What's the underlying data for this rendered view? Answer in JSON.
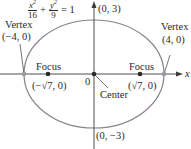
{
  "equation": {
    "term1_num": "x",
    "term1_den": "16",
    "plus": "+",
    "term2_num": "y",
    "term2_den": "9",
    "equals": "= 1",
    "exponent": "2"
  },
  "labels": {
    "vertex_left_title": "Vertex",
    "vertex_left_coord": "(−4, 0)",
    "vertex_right_title": "Vertex",
    "vertex_right_coord": "(4, 0)",
    "focus_left_title": "Focus",
    "focus_left_coord": "(−√7, 0)",
    "focus_right_title": "Focus",
    "focus_right_coord": "(√7, 0)",
    "top_point": "(0, 3)",
    "bottom_point": "(0, −3)",
    "origin": "0",
    "center": "Center",
    "x_axis": "x"
  },
  "colors": {
    "ellipse": "#8a7f8c",
    "axis": "#3a3a3a",
    "vertex_point": "#9a9aa0",
    "focus_point": "#2a2a2a"
  }
}
